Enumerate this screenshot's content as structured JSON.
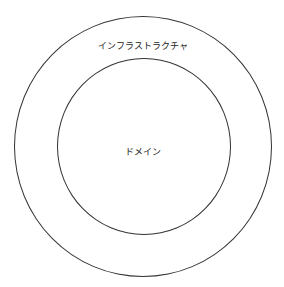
{
  "diagram": {
    "type": "concentric-circles",
    "layers": [
      {
        "id": "outer",
        "label": "インフラストラクチャ"
      },
      {
        "id": "inner",
        "label": "ドメイン"
      }
    ],
    "stroke_color": "#333333",
    "background": "#ffffff"
  }
}
